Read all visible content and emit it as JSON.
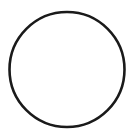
{
  "image": {
    "kind": "line-drawing",
    "subject": "circle-outline",
    "width": 138,
    "height": 139,
    "background_color": "#ffffff",
    "ink_color": "#1a1a1a",
    "text_content": "",
    "annotations": [],
    "shapes": [
      {
        "name": "circle-outline",
        "type": "circle",
        "center_x": 67,
        "center_y": 69.5,
        "radius": 57.5,
        "stroke_color": "#1a1a1a",
        "stroke_width": 2.6,
        "fill": "none"
      }
    ]
  }
}
